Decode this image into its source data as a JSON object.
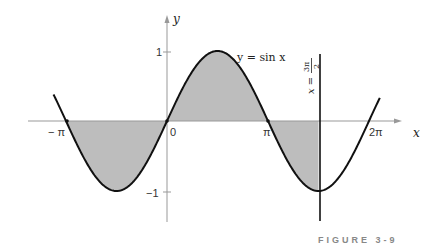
{
  "figure": {
    "caption": "FIGURE 3-9",
    "curve_label": "y = sin x",
    "vline_label_lhs": "x =",
    "vline_label_num": "3π",
    "vline_label_den": "2",
    "axis_x_label": "x",
    "axis_y_label": "y",
    "x_ticks": [
      {
        "label": "− π",
        "value": -3.14159
      },
      {
        "label": "0",
        "value": 0
      },
      {
        "label": "π",
        "value": 3.14159
      },
      {
        "label": "2π",
        "value": 6.28318
      }
    ],
    "y_ticks": [
      {
        "label": "1",
        "value": 1
      },
      {
        "label": "−1",
        "value": -1
      }
    ],
    "colors": {
      "curve": "#111111",
      "shade": "#bdbdbd",
      "axis": "#999999",
      "caption": "#888888"
    }
  },
  "chart_data": {
    "type": "line",
    "title": "",
    "function": "y = sin x",
    "xlabel": "x",
    "ylabel": "y",
    "xlim": [
      -3.5,
      6.6
    ],
    "ylim": [
      -1.4,
      1.3
    ],
    "grid": false,
    "shaded_region": {
      "from": -3.14159,
      "to": 4.71239,
      "between": "curve and x-axis"
    },
    "vertical_line": {
      "x": 4.71239,
      "label": "x = 3π/2"
    },
    "marked_points": [
      {
        "x": -3.14159,
        "y": 0
      },
      {
        "x": 0,
        "y": 0
      },
      {
        "x": 3.14159,
        "y": 0
      }
    ],
    "x_tick_labels": [
      "−π",
      "0",
      "π",
      "2π"
    ],
    "y_tick_labels": [
      "1",
      "−1"
    ],
    "caption": "FIGURE 3-9"
  }
}
